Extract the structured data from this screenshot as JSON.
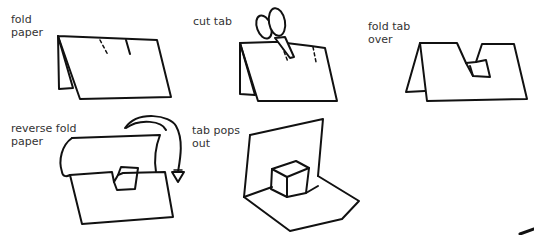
{
  "steps": [
    {
      "id": 1,
      "label": "fold\npaper"
    },
    {
      "id": 2,
      "label": "cut tab"
    },
    {
      "id": 3,
      "label": "fold tab\nover"
    },
    {
      "id": 4,
      "label": "reverse fold\npaper"
    },
    {
      "id": 5,
      "label": "tab pops\nout"
    }
  ],
  "colors": {
    "line": "#111111",
    "text": "#333333",
    "background": "#ffffff"
  }
}
